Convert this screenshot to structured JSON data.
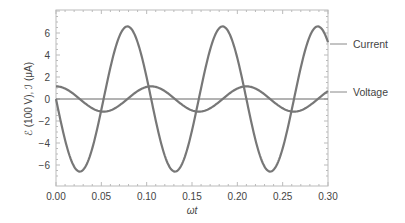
{
  "chart_data": {
    "type": "line",
    "title": "",
    "xlabel": "ωt",
    "ylabel": "ℰ (100 V), ℐ (μA)",
    "xlim": [
      0,
      0.3
    ],
    "ylim": [
      -7.3,
      8.1
    ],
    "xticks": [
      "0.00",
      "0.05",
      "0.10",
      "0.15",
      "0.20",
      "0.25",
      "0.30"
    ],
    "yticks": [
      "-6",
      "-4",
      "-2",
      "0",
      "2",
      "4",
      "6"
    ],
    "grid": false,
    "legend_position": "right, inline labels",
    "series": [
      {
        "name": "Current",
        "description": "I = -6.6 sin(2π t / 0.105)",
        "amplitude": 6.6,
        "period": 0.105,
        "x": [
          0.0,
          0.026,
          0.053,
          0.079,
          0.105,
          0.131,
          0.158,
          0.184,
          0.21,
          0.236,
          0.263,
          0.289,
          0.3
        ],
        "values": [
          0.0,
          -6.6,
          0.0,
          6.6,
          0.0,
          -6.6,
          0.0,
          6.6,
          0.0,
          -6.6,
          0.0,
          6.6,
          5.0
        ]
      },
      {
        "name": "Voltage",
        "description": "V = 1.15 cos(2π t / 0.105)",
        "amplitude": 1.15,
        "period": 0.105,
        "x": [
          0.0,
          0.026,
          0.053,
          0.079,
          0.105,
          0.131,
          0.158,
          0.184,
          0.21,
          0.236,
          0.263,
          0.289,
          0.3
        ],
        "values": [
          1.15,
          0.0,
          -1.15,
          0.0,
          1.15,
          0.0,
          -1.15,
          0.0,
          1.15,
          0.0,
          -1.15,
          0.0,
          0.65
        ]
      }
    ]
  },
  "labels": {
    "current": "Current",
    "voltage": "Voltage",
    "xlabel": "ωt",
    "ylabel": "ℰ (100 V), ℐ (μA)"
  }
}
